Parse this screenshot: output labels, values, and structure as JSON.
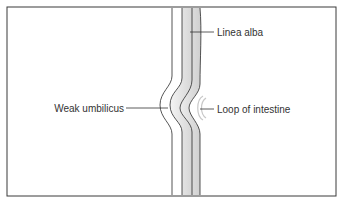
{
  "diagram": {
    "type": "anatomical-cross-section",
    "labels": {
      "linea_alba": "Linea alba",
      "weak_umbilicus": "Weak umbilicus",
      "loop_of_intestine": "Loop of intestine"
    },
    "colors": {
      "border": "#333333",
      "line": "#2a2a2a",
      "shading": "#dcdcdc",
      "text": "#333333",
      "background": "#ffffff"
    }
  }
}
